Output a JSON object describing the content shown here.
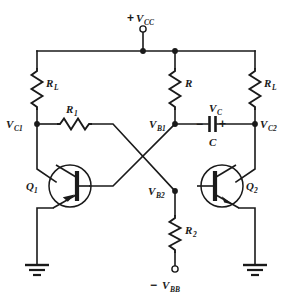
{
  "diagram": {
    "type": "electronic-schematic",
    "background_color": "#ffffff",
    "line_color": "#1a1a1a"
  },
  "supplies": {
    "vcc": {
      "sign": "+",
      "symbol": "V",
      "subscript": "CC",
      "terminal": "open-circle"
    },
    "vbb": {
      "sign": "−",
      "symbol": "V",
      "subscript": "BB",
      "terminal": "open-circle"
    }
  },
  "components": {
    "rl_left": {
      "symbol": "R",
      "subscript": "L",
      "type": "resistor",
      "orientation": "vertical"
    },
    "rl_right": {
      "symbol": "R",
      "subscript": "L",
      "type": "resistor",
      "orientation": "vertical"
    },
    "r_mid": {
      "symbol": "R",
      "subscript": "",
      "type": "resistor",
      "orientation": "vertical"
    },
    "r1": {
      "symbol": "R",
      "subscript": "1",
      "type": "resistor",
      "orientation": "horizontal"
    },
    "r2": {
      "symbol": "R",
      "subscript": "2",
      "type": "resistor",
      "orientation": "vertical"
    },
    "cap": {
      "symbol": "C",
      "type": "capacitor",
      "voltage_label": "V",
      "voltage_subscript": "C",
      "polarity_left": "−",
      "polarity_right": "+"
    },
    "q1": {
      "symbol": "Q",
      "subscript": "1",
      "type": "npn-transistor",
      "mirrored": true
    },
    "q2": {
      "symbol": "Q",
      "subscript": "2",
      "type": "npn-transistor",
      "mirrored": false
    }
  },
  "nodes": {
    "vc1": {
      "symbol": "V",
      "subscript": "C1"
    },
    "vc2": {
      "symbol": "V",
      "subscript": "C2"
    },
    "vb1": {
      "symbol": "V",
      "subscript": "B1"
    },
    "vb2": {
      "symbol": "V",
      "subscript": "B2"
    }
  },
  "grounds": [
    {
      "id": "ground-left"
    },
    {
      "id": "ground-right"
    }
  ]
}
